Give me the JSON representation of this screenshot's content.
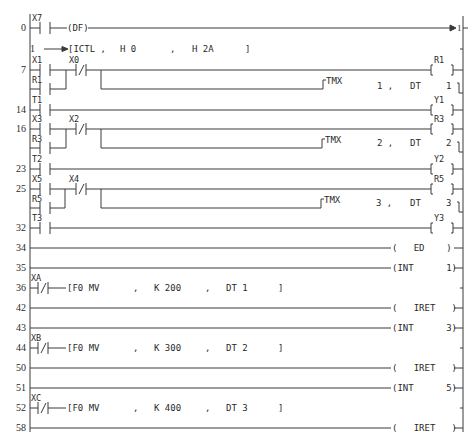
{
  "diagram": {
    "type": "ladder-logic",
    "rails": {
      "left_x": 30,
      "right_x": 463
    },
    "step_numbers": [
      "0",
      "1",
      "7",
      "14",
      "16",
      "23",
      "25",
      "32",
      "34",
      "35",
      "36",
      "42",
      "43",
      "44",
      "50",
      "51",
      "52",
      "58"
    ],
    "rungs": [
      {
        "step": "0",
        "contact": "X7",
        "contact_type": "NO",
        "instruction": "(DF)",
        "jump_label": "1"
      },
      {
        "step": "1",
        "instruction": "[ICTL ,",
        "arg1": "H 0",
        "sep": ",",
        "arg2": "H 2A",
        "close": "]"
      },
      {
        "step": "7",
        "contact": "X1",
        "parallel_contact": "R1",
        "nc_contact": "X0",
        "coil": "R1",
        "timer": {
          "name": "TMX",
          "number": "1 ,",
          "dest": "DT",
          "dest_no": "1"
        }
      },
      {
        "step": "14",
        "contact": "T1",
        "coil": "Y1"
      },
      {
        "step": "16",
        "contact": "X3",
        "parallel_contact": "R3",
        "nc_contact": "X2",
        "coil": "R3",
        "timer": {
          "name": "TMX",
          "number": "2 ,",
          "dest": "DT",
          "dest_no": "2"
        }
      },
      {
        "step": "23",
        "contact": "T2",
        "coil": "Y2"
      },
      {
        "step": "25",
        "contact": "X5",
        "parallel_contact": "R5",
        "nc_contact": "X4",
        "coil": "R5",
        "timer": {
          "name": "TMX",
          "number": "3 ,",
          "dest": "DT",
          "dest_no": "3"
        }
      },
      {
        "step": "32",
        "contact": "T3",
        "coil": "Y3"
      },
      {
        "step": "34",
        "end": "(   ED    )"
      },
      {
        "step": "35",
        "end": "(INT      1)"
      },
      {
        "step": "36",
        "contact": "XA",
        "contact_type": "NC",
        "instruction": "[F0 MV",
        "sep1": ",",
        "arg1": "K 200",
        "sep2": ",",
        "arg2": "DT 1",
        "close": "]"
      },
      {
        "step": "42",
        "end": "(   IRET   )"
      },
      {
        "step": "43",
        "end": "(INT      3)"
      },
      {
        "step": "44",
        "contact": "XB",
        "contact_type": "NC",
        "instruction": "[F0 MV",
        "sep1": ",",
        "arg1": "K 300",
        "sep2": ",",
        "arg2": "DT 2",
        "close": "]"
      },
      {
        "step": "50",
        "end": "(   IRET   )"
      },
      {
        "step": "51",
        "end": "(INT      5)"
      },
      {
        "step": "52",
        "contact": "XC",
        "contact_type": "NC",
        "instruction": "[F0 MV",
        "sep1": ",",
        "arg1": "K 400",
        "sep2": ",",
        "arg2": "DT 3",
        "close": "]"
      },
      {
        "step": "58",
        "end": "(   IRET   )"
      }
    ]
  }
}
